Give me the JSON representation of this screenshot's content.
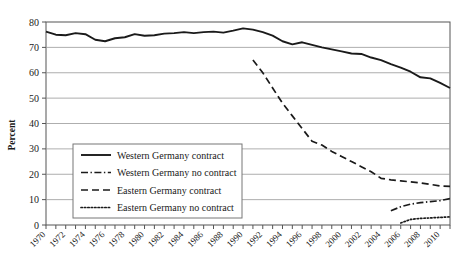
{
  "chart_data": {
    "type": "line",
    "title": "",
    "xlabel": "",
    "ylabel": "Percent",
    "ylim": [
      0,
      80
    ],
    "ytick_step": 10,
    "yticks": [
      "0",
      "10",
      "20",
      "30",
      "40",
      "50",
      "60",
      "70",
      "80"
    ],
    "xlim": [
      1970,
      2011
    ],
    "xtick_step": 1,
    "xlabel_step": 2,
    "xticks": [
      "1970",
      "1972",
      "1974",
      "1976",
      "1978",
      "1980",
      "1982",
      "1984",
      "1986",
      "1988",
      "1990",
      "1992",
      "1994",
      "1996",
      "1998",
      "2000",
      "2002",
      "2004",
      "2006",
      "2008",
      "2010"
    ],
    "grid": "horizontal",
    "legend_position": "lower-left-inside",
    "series": [
      {
        "name": "Western Germany contract",
        "style": "solid",
        "color": "#1a1a1a",
        "x": [
          1970,
          1971,
          1972,
          1973,
          1974,
          1975,
          1976,
          1977,
          1978,
          1979,
          1980,
          1981,
          1982,
          1983,
          1984,
          1985,
          1986,
          1987,
          1988,
          1989,
          1990,
          1991,
          1992,
          1993,
          1994,
          1995,
          1996,
          1997,
          1998,
          1999,
          2000,
          2001,
          2002,
          2003,
          2004,
          2005,
          2006,
          2007,
          2008,
          2009,
          2010,
          2011
        ],
        "values": [
          76.2,
          75.0,
          74.8,
          75.6,
          75.2,
          73.0,
          72.4,
          73.6,
          74.0,
          75.2,
          74.6,
          74.8,
          75.4,
          75.6,
          76.0,
          75.6,
          76.0,
          76.2,
          75.8,
          76.6,
          77.5,
          77.0,
          76.0,
          74.6,
          72.4,
          71.2,
          72.0,
          71.0,
          70.0,
          69.2,
          68.4,
          67.6,
          67.4,
          66.0,
          65.0,
          63.4,
          62.0,
          60.4,
          58.2,
          57.8,
          56.0,
          54.0
        ]
      },
      {
        "name": "Western Germany no contract",
        "style": "dash-dot",
        "color": "#1a1a1a",
        "x": [
          2005,
          2006,
          2007,
          2008,
          2009,
          2010,
          2011
        ],
        "values": [
          5.6,
          7.2,
          8.2,
          8.8,
          9.2,
          9.6,
          10.4
        ]
      },
      {
        "name": "Eastern Germany contract",
        "style": "dashed",
        "color": "#1a1a1a",
        "x": [
          1991,
          1992,
          1993,
          1994,
          1995,
          1996,
          1997,
          1998,
          1999,
          2000,
          2001,
          2002,
          2003,
          2004,
          2005,
          2006,
          2007,
          2008,
          2009,
          2010,
          2011
        ],
        "values": [
          65.0,
          60.0,
          54.0,
          48.0,
          43.0,
          38.0,
          33.0,
          31.5,
          29.0,
          27.0,
          25.0,
          23.0,
          21.0,
          18.4,
          17.8,
          17.4,
          17.0,
          16.6,
          16.0,
          15.4,
          15.2
        ]
      },
      {
        "name": "Eastern Germany no contract",
        "style": "dotted",
        "color": "#1a1a1a",
        "x": [
          2006,
          2007,
          2008,
          2009,
          2010,
          2011
        ],
        "values": [
          0.8,
          2.2,
          2.6,
          2.8,
          3.0,
          3.2
        ]
      }
    ]
  },
  "legend": {
    "items": [
      {
        "label": "Western Germany contract",
        "style": "solid"
      },
      {
        "label": "Western Germany no contract",
        "style": "dash-dot"
      },
      {
        "label": "Eastern Germany contract",
        "style": "dashed"
      },
      {
        "label": "Eastern Germany no contract",
        "style": "dotted"
      }
    ]
  },
  "axes": {
    "y_title": "Percent"
  }
}
